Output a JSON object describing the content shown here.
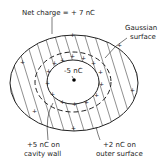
{
  "diagram": {
    "title_label": "Net charge = + 7 nC",
    "gaussian_label_line1": "Gaussian",
    "gaussian_label_line2": "surface",
    "point_charge_label": "-5 nC",
    "cavity_label_line1": "+5 nC on",
    "cavity_label_line2": "cavity wall",
    "outer_label_line1": "+2 nC on",
    "outer_label_line2": "outer surface",
    "colors": {
      "stroke": "#222222",
      "background": "#ffffff"
    }
  }
}
